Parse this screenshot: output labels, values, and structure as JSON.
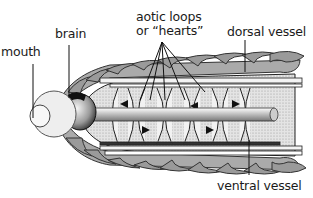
{
  "diagram": {
    "labels": {
      "mouth": "mouth",
      "brain": "brain",
      "aortic_line1": "aotic loops",
      "aortic_line2": "or “hearts”",
      "dorsal": "dorsal vessel",
      "ventral": "ventral vessel"
    },
    "colors": {
      "segment_fill": "#9a9a9a",
      "segment_stroke": "#333333",
      "interior_fill": "#d8d8d8",
      "loop_fill": "#f2f2f2",
      "line": "#111111",
      "head_fill": "#eeeeee"
    }
  }
}
